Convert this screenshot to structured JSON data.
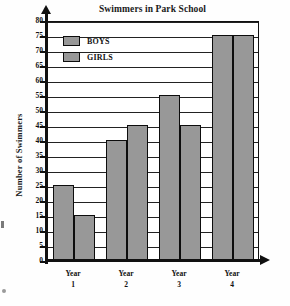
{
  "chart_data": {
    "type": "bar",
    "title": "Swimmers in Park School",
    "xlabel": "",
    "ylabel": "Number of Swimmers",
    "categories": [
      "Year 1",
      "Year 2",
      "Year 3",
      "Year 4"
    ],
    "category_lines": [
      {
        "line1": "Year",
        "line2": "1"
      },
      {
        "line1": "Year",
        "line2": "2"
      },
      {
        "line1": "Year",
        "line2": "3"
      },
      {
        "line1": "Year",
        "line2": "4"
      }
    ],
    "series": [
      {
        "name": "BOYS",
        "values": [
          25,
          40,
          55,
          75
        ],
        "color": "#989898"
      },
      {
        "name": "GIRLS",
        "values": [
          15,
          45,
          45,
          75
        ],
        "color": "#989898"
      }
    ],
    "ylim": [
      0,
      80
    ],
    "ytick_step": 5,
    "yticks": [
      0,
      5,
      10,
      15,
      20,
      25,
      30,
      35,
      40,
      45,
      50,
      55,
      60,
      65,
      70,
      75,
      80
    ],
    "ytick_labels": [
      "0",
      "5",
      "10",
      "15",
      "20",
      "25",
      "30",
      "35",
      "40",
      "45",
      "50",
      "55",
      "60",
      "65",
      "70",
      "75",
      "80"
    ],
    "grid": true,
    "grid_axis": "y",
    "legend_position": "top-left-inside",
    "bar_border_color": "#0d0d0d",
    "axis_color": "#111111"
  },
  "legend": {
    "entries": [
      {
        "label": "BOYS",
        "swatch_name": "legend-swatch-boys"
      },
      {
        "label": "GIRLS",
        "swatch_name": "legend-swatch-girls"
      }
    ]
  }
}
